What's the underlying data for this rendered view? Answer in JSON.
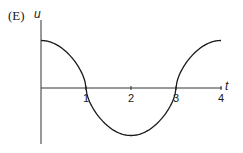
{
  "panel_label": "(E)",
  "chart_data": {
    "type": "line",
    "title": "",
    "xlabel": "t",
    "ylabel": "u",
    "xticks": [
      "1",
      "2",
      "3",
      "4"
    ],
    "xlim": [
      0,
      4
    ],
    "ylim": [
      -1,
      1
    ],
    "grid": false,
    "legend": null,
    "series": [
      {
        "name": "u(t)",
        "x": [
          0,
          0.25,
          0.5,
          0.75,
          1,
          1.25,
          1.5,
          1.75,
          2,
          2.25,
          2.5,
          2.75,
          3,
          3.25,
          3.5,
          3.75,
          4
        ],
        "values": [
          1,
          0.98,
          0.86,
          0.55,
          0,
          -0.55,
          -0.86,
          -0.98,
          -1,
          -0.98,
          -0.86,
          -0.55,
          0,
          0.55,
          0.86,
          0.98,
          1
        ]
      }
    ],
    "annotations": [
      "zero crossings at t=1 and t=3",
      "minimum at t=2"
    ]
  },
  "style": {
    "line_color": "#1a1a1a",
    "axis_color": "#333333"
  }
}
